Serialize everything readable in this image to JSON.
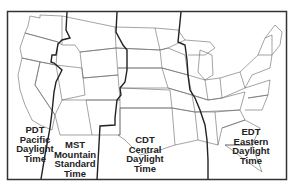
{
  "map": {
    "title": "US Time Zones",
    "colors": {
      "background": "#ffffff",
      "frame": "#333333",
      "state_line": "#666666",
      "zone_line": "#222222",
      "text": "#222222"
    },
    "zones": [
      {
        "abbr": "PDT",
        "name": "Pacific",
        "line1": "Daylight",
        "line2": "Time"
      },
      {
        "abbr": "MST",
        "name": "Mountain",
        "line1": "Standard",
        "line2": "Time"
      },
      {
        "abbr": "CDT",
        "name": "Central",
        "line1": "Daylight",
        "line2": "Time"
      },
      {
        "abbr": "EDT",
        "name": "Eastern",
        "line1": "Daylight",
        "line2": "Time"
      }
    ]
  }
}
